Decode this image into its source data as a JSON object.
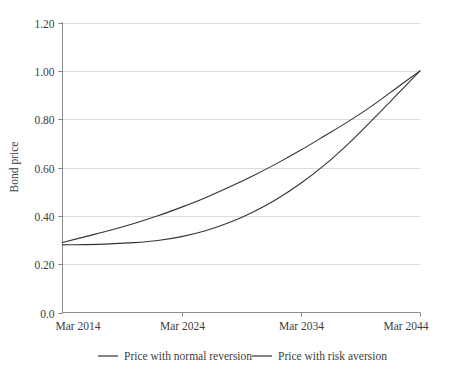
{
  "chart_data": {
    "type": "line",
    "title": "",
    "xlabel": "",
    "ylabel": "Bond price",
    "grid": true,
    "legend_position": "bottom",
    "x_ticks": [
      "Mar 2014",
      "Mar 2024",
      "Mar 2034",
      "Mar 2044"
    ],
    "x_tick_values": [
      2014,
      2024,
      2034,
      2044
    ],
    "xlim": [
      2014,
      2044
    ],
    "y_ticks": [
      "0.0",
      "0.20",
      "0.40",
      "0.60",
      "0.80",
      "1.00",
      "1.20"
    ],
    "y_tick_values": [
      0.0,
      0.2,
      0.4,
      0.6,
      0.8,
      1.0,
      1.2
    ],
    "ylim": [
      0.0,
      1.2
    ],
    "x": [
      2014,
      2016,
      2018,
      2020,
      2022,
      2024,
      2026,
      2028,
      2030,
      2032,
      2034,
      2036,
      2038,
      2040,
      2042,
      2044
    ],
    "series": [
      {
        "name": "Price with normal reversion",
        "color": "#333333",
        "values": [
          0.29,
          0.315,
          0.34,
          0.368,
          0.4,
          0.436,
          0.475,
          0.519,
          0.566,
          0.617,
          0.672,
          0.731,
          0.791,
          0.856,
          0.928,
          1.0
        ]
      },
      {
        "name": "Price with risk aversion",
        "color": "#333333",
        "values": [
          0.28,
          0.281,
          0.284,
          0.289,
          0.298,
          0.314,
          0.338,
          0.372,
          0.416,
          0.47,
          0.535,
          0.611,
          0.699,
          0.797,
          0.898,
          1.0
        ]
      }
    ]
  },
  "legend": {
    "items": [
      {
        "label": "Price with normal reversion"
      },
      {
        "label": "Price with risk aversion"
      }
    ]
  },
  "axes": {
    "y_axis_title": "Bond price"
  },
  "colors": {
    "line": "#333333",
    "gridline": "#dcdcdc",
    "axis": "#808080",
    "text": "#3d3d3d",
    "background": "#ffffff"
  }
}
